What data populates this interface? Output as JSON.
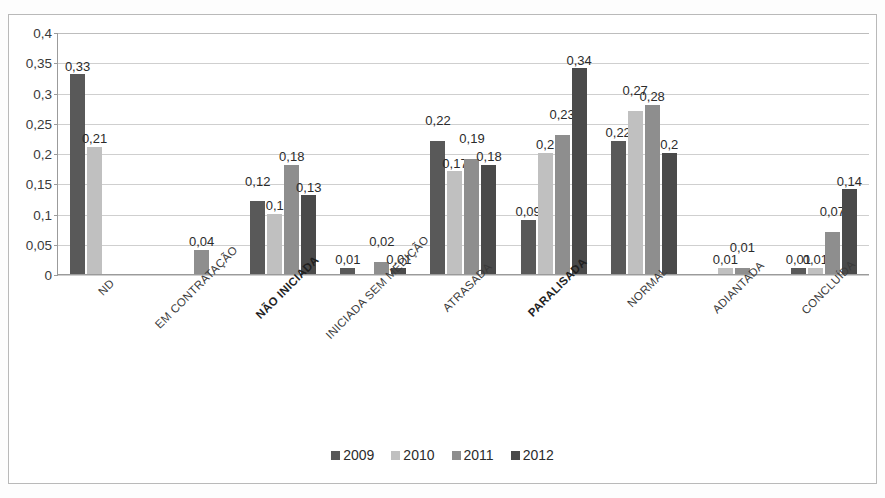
{
  "title": "",
  "legend_position": "bottom",
  "chart_data": {
    "type": "bar",
    "title": "",
    "subtitle": "",
    "xlabel": "",
    "ylabel": "",
    "ylim": [
      0,
      0.4
    ],
    "ytick_values": [
      0,
      0.05,
      0.1,
      0.15,
      0.2,
      0.25,
      0.3,
      0.35,
      0.4
    ],
    "ytick_labels": [
      "0",
      "0,05",
      "0,1",
      "0,15",
      "0,2",
      "0,25",
      "0,3",
      "0,35",
      "0,4"
    ],
    "grid": true,
    "decimal_separator": ",",
    "legend": [
      "2009",
      "2010",
      "2011",
      "2012"
    ],
    "categories": [
      "ND",
      "EM CONTRATAÇÃO",
      "NÃO INICIADA",
      "INICIADA SEM MEDIÇÃO",
      "ATRASADA",
      "PARALISADA",
      "NORMAL",
      "ADIANTADA",
      "CONCLUÍDA"
    ],
    "emphasized_categories": [
      "NÃO INICIADA",
      "PARALISADA"
    ],
    "series": [
      {
        "name": "2009",
        "color": "#595959",
        "values": [
          0.33,
          null,
          0.12,
          0.01,
          0.22,
          0.09,
          0.22,
          null,
          0.01
        ],
        "labels": [
          "0,33",
          "",
          "0,12",
          "0,01",
          "0,22",
          "0,09",
          "0,22",
          "",
          "0,01"
        ]
      },
      {
        "name": "2010",
        "color": "#c0c0c0",
        "values": [
          0.21,
          null,
          0.1,
          null,
          0.17,
          0.2,
          0.27,
          0.01,
          0.01
        ],
        "labels": [
          "0,21",
          "",
          "0,1",
          "",
          "0,17",
          "0,2",
          "0,27",
          "0,01",
          "0,01"
        ]
      },
      {
        "name": "2011",
        "color": "#8e8e8e",
        "values": [
          null,
          0.04,
          0.18,
          0.02,
          0.19,
          0.23,
          0.28,
          0.01,
          0.07
        ],
        "labels": [
          "",
          "0,04",
          "0,18",
          "0,02",
          "0,19",
          "0,23",
          "0,28",
          "0,01",
          "0,07"
        ]
      },
      {
        "name": "2012",
        "color": "#4a4a4a",
        "values": [
          null,
          null,
          0.13,
          0.01,
          0.18,
          0.34,
          0.2,
          null,
          0.14
        ],
        "labels": [
          "",
          "",
          "0,13",
          "0,01",
          "0,18",
          "0,34",
          "0,2",
          "",
          "0,14"
        ]
      }
    ]
  }
}
